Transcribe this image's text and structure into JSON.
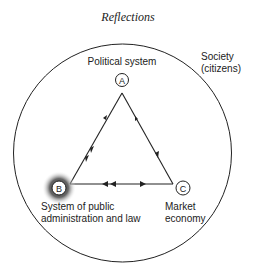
{
  "title": "Reflections",
  "outer": {
    "label_line1": "Society",
    "label_line2": "(citizens)"
  },
  "nodes": {
    "A": {
      "letter": "A",
      "label_line1": "Political system"
    },
    "B": {
      "letter": "B",
      "label_line1": "System of public",
      "label_line2": "administration and law"
    },
    "C": {
      "letter": "C",
      "label_line1": "Market",
      "label_line2": "economy"
    }
  },
  "colors": {
    "line": "#222222",
    "highlight": "#555555"
  }
}
